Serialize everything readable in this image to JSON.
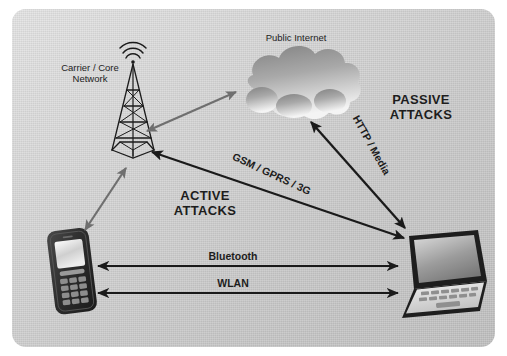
{
  "diagram": {
    "background_color": "#d6d6d6",
    "page_color": "#ffffff",
    "nodes": [
      {
        "id": "tower",
        "icon": "cell-tower-icon",
        "label": "Carrier / Core\nNetwork",
        "label_line1": "Carrier / Core",
        "label_line2": "Network"
      },
      {
        "id": "cloud",
        "icon": "cloud-icon",
        "label": "Public Internet"
      },
      {
        "id": "phone",
        "icon": "mobile-phone-icon",
        "label": ""
      },
      {
        "id": "laptop",
        "icon": "laptop-icon",
        "label": ""
      }
    ],
    "labels": {
      "carrier_line1": "Carrier / Core",
      "carrier_line2": "Network",
      "public_internet": "Public Internet",
      "passive_line1": "PASSIVE",
      "passive_line2": "ATTACKS",
      "active_line1": "ACTIVE",
      "active_line2": "ATTACKS",
      "bluetooth": "Bluetooth",
      "wlan": "WLAN",
      "gsm": "GSM / GPRS / 3G",
      "http_media": "HTTP / Media"
    },
    "links": [
      {
        "id": "tower-cloud",
        "from": "tower",
        "to": "cloud",
        "label": "",
        "color": "#6f6f6f",
        "arrow": "double"
      },
      {
        "id": "tower-phone",
        "from": "tower",
        "to": "phone",
        "label": "",
        "color": "#6f6f6f",
        "arrow": "double"
      },
      {
        "id": "tower-laptop",
        "from": "tower",
        "to": "laptop",
        "label": "GSM / GPRS / 3G",
        "color": "#1a1a1a",
        "arrow": "double"
      },
      {
        "id": "cloud-laptop",
        "from": "cloud",
        "to": "laptop",
        "label": "HTTP / Media",
        "color": "#1a1a1a",
        "arrow": "double"
      },
      {
        "id": "phone-laptop-bt",
        "from": "phone",
        "to": "laptop",
        "label": "Bluetooth",
        "color": "#1a1a1a",
        "arrow": "double"
      },
      {
        "id": "phone-laptop-wlan",
        "from": "phone",
        "to": "laptop",
        "label": "WLAN",
        "color": "#1a1a1a",
        "arrow": "double"
      }
    ],
    "colors": {
      "text": "#1d1d1d",
      "gray_arrow": "#6f6f6f",
      "black_arrow": "#1a1a1a",
      "cloud_dark": "#7d7d7d",
      "cloud_light": "#f2f2f2",
      "device_dark": "#2b2b2b",
      "screen_light": "#e8e8e8"
    }
  }
}
